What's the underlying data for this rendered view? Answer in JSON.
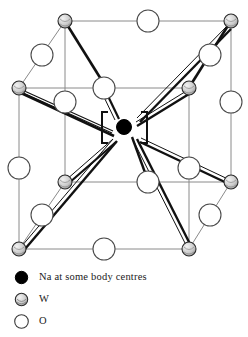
{
  "figure": {
    "colors": {
      "cell_edge": "#8a8a8a",
      "bond": "#111111",
      "na_fill": "#000000",
      "w_fill": "#c9c9c9",
      "o_fill": "#ffffff",
      "outline": "#444444"
    },
    "cell": {
      "front": {
        "left": 19,
        "right": 189,
        "top": 88,
        "bottom": 249
      },
      "back": {
        "left": 65,
        "right": 231,
        "top": 21,
        "bottom": 182
      }
    },
    "na_centre": {
      "cx": 124,
      "cy": 127,
      "r": 7.5,
      "label": "Na"
    },
    "brackets": {
      "left": "[",
      "right": "]",
      "left_x": 104,
      "right_x": 145,
      "y": 127
    },
    "w_atoms": [
      {
        "name": "w-back-top-left",
        "cx": 65,
        "cy": 21,
        "r": 7
      },
      {
        "name": "w-back-top-right",
        "cx": 231,
        "cy": 21,
        "r": 7
      },
      {
        "name": "w-front-top-left",
        "cx": 19,
        "cy": 88,
        "r": 7
      },
      {
        "name": "w-front-top-right",
        "cx": 189,
        "cy": 88,
        "r": 7
      },
      {
        "name": "w-back-bottom-left",
        "cx": 65,
        "cy": 182,
        "r": 7
      },
      {
        "name": "w-back-bottom-right",
        "cx": 231,
        "cy": 182,
        "r": 7
      },
      {
        "name": "w-front-bottom-left",
        "cx": 19,
        "cy": 249,
        "r": 7
      },
      {
        "name": "w-front-bottom-right",
        "cx": 189,
        "cy": 249,
        "r": 7
      }
    ],
    "o_atoms": [
      {
        "name": "o-back-top-edge",
        "cx": 148,
        "cy": 21,
        "r": 11
      },
      {
        "name": "o-back-left-upper",
        "cx": 42,
        "cy": 55,
        "r": 11
      },
      {
        "name": "o-back-right-upper",
        "cx": 210,
        "cy": 55,
        "r": 11
      },
      {
        "name": "o-front-top-edge",
        "cx": 104,
        "cy": 88,
        "r": 11
      },
      {
        "name": "o-front-left-vertical",
        "cx": 19,
        "cy": 168,
        "r": 11
      },
      {
        "name": "o-front-right-vertical",
        "cx": 189,
        "cy": 168,
        "r": 11
      },
      {
        "name": "o-back-left-vertical",
        "cx": 65,
        "cy": 102,
        "r": 11
      },
      {
        "name": "o-back-right-vertical",
        "cx": 231,
        "cy": 102,
        "r": 11
      },
      {
        "name": "o-back-bottom-edge",
        "cx": 148,
        "cy": 182,
        "r": 11
      },
      {
        "name": "o-back-left-lower",
        "cx": 42,
        "cy": 215,
        "r": 11
      },
      {
        "name": "o-back-right-lower",
        "cx": 210,
        "cy": 215,
        "r": 11
      },
      {
        "name": "o-front-bottom-edge",
        "cx": 104,
        "cy": 249,
        "r": 11
      }
    ],
    "bonds": [
      {
        "name": "bond-o-front-top-to-na",
        "x1": 104,
        "y1": 88,
        "x2": 116,
        "y2": 118,
        "w": 2.2,
        "double": true
      },
      {
        "name": "bond-o-back-right-vert-to-na",
        "x1": 231,
        "y1": 102,
        "x2": 138,
        "y2": 120,
        "w": 2.2,
        "double": true
      },
      {
        "name": "bond-o-back-left-vert-to-na",
        "x1": 65,
        "y1": 102,
        "x2": 112,
        "y2": 135,
        "w": 2.2,
        "double": true
      },
      {
        "name": "bond-o-back-bottom-to-na",
        "x1": 148,
        "y1": 182,
        "x2": 133,
        "y2": 138,
        "w": 2.2,
        "double": true
      },
      {
        "name": "bond-na-to-lower-left",
        "x1": 114,
        "y1": 140,
        "x2": 19,
        "y2": 249,
        "w": 2.2,
        "double": true
      },
      {
        "name": "bond-na-to-lower-right",
        "x1": 136,
        "y1": 140,
        "x2": 189,
        "y2": 249,
        "w": 2.2,
        "double": true
      },
      {
        "name": "bond-o-back-left-upper-to-w",
        "x1": 65,
        "y1": 21,
        "x2": 104,
        "y2": 88,
        "w": 2.2,
        "double": false
      },
      {
        "name": "bond-w-backtopright-to-front",
        "x1": 231,
        "y1": 21,
        "x2": 189,
        "y2": 88,
        "w": 2.2,
        "double": false
      },
      {
        "name": "bond-w-fronttopleft-to-centre",
        "x1": 19,
        "y1": 88,
        "x2": 112,
        "y2": 132,
        "w": 2.2,
        "double": true
      },
      {
        "name": "bond-w-backbottomleft-up",
        "x1": 65,
        "y1": 182,
        "x2": 113,
        "y2": 140,
        "w": 2.2,
        "double": true
      },
      {
        "name": "bond-w-backbottomright-up",
        "x1": 231,
        "y1": 182,
        "x2": 140,
        "y2": 140,
        "w": 2.2,
        "double": true
      },
      {
        "name": "bond-w-frontbottomright-up",
        "x1": 189,
        "y1": 249,
        "x2": 137,
        "y2": 143,
        "w": 2.2,
        "double": true
      }
    ]
  },
  "legend": {
    "items": [
      {
        "marker": "filled-circle-icon",
        "label": "Na at some body centres"
      },
      {
        "marker": "shaded-circle-icon",
        "label": "W"
      },
      {
        "marker": "open-circle-icon",
        "label": "O"
      }
    ]
  }
}
